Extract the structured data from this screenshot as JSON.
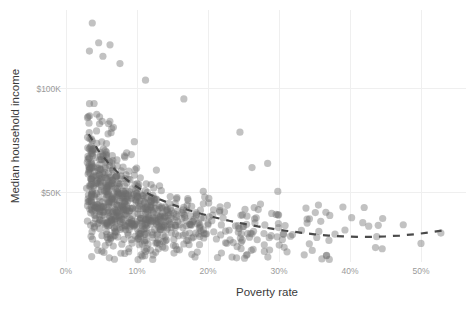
{
  "chart_data": {
    "type": "scatter",
    "title": "",
    "xlabel": "Poverty rate",
    "ylabel": "Median household income",
    "xticks": [
      "0%",
      "10%",
      "20%",
      "30%",
      "40%",
      "50%"
    ],
    "xtick_values": [
      0,
      10,
      20,
      30,
      40,
      50
    ],
    "yticks": [
      "$50K",
      "$100K"
    ],
    "ytick_values": [
      50000,
      100000
    ],
    "xlim": [
      -1.5,
      55
    ],
    "ylim": [
      14000,
      140000
    ],
    "grid": true,
    "legend": "none",
    "point_color": "#6e6e6e",
    "point_opacity": 0.42,
    "point_radius": 3.6,
    "trend": {
      "style": "dashed",
      "color": "#4a4a4a",
      "label": "",
      "points": [
        [
          3.2,
          78000
        ],
        [
          4.5,
          70500
        ],
        [
          6.0,
          64000
        ],
        [
          7.5,
          59000
        ],
        [
          9.0,
          55000
        ],
        [
          11.0,
          50500
        ],
        [
          13.0,
          47000
        ],
        [
          15.0,
          44200
        ],
        [
          17.0,
          41800
        ],
        [
          19.0,
          39800
        ],
        [
          21.0,
          38000
        ],
        [
          23.0,
          36400
        ],
        [
          25.0,
          35000
        ],
        [
          27.0,
          33700
        ],
        [
          29.0,
          32600
        ],
        [
          31.0,
          31600
        ],
        [
          33.0,
          30700
        ],
        [
          35.0,
          29900
        ],
        [
          37.0,
          29300
        ],
        [
          39.0,
          28900
        ],
        [
          41.0,
          28700
        ],
        [
          43.0,
          28700
        ],
        [
          45.0,
          28900
        ],
        [
          47.0,
          29300
        ],
        [
          49.0,
          29900
        ],
        [
          51.0,
          30700
        ],
        [
          53.0,
          31700
        ]
      ]
    },
    "series": [
      {
        "name": "counties",
        "n_points": 820,
        "description": "Median household income vs poverty rate, one point per county; strong negative hyperbolic relationship."
      }
    ]
  },
  "axes": {
    "x_label": "Poverty rate",
    "y_label": "Median household income",
    "x_tick_labels": [
      "0%",
      "10%",
      "20%",
      "30%",
      "40%",
      "50%"
    ],
    "y_tick_labels": [
      "$100K",
      "$50K"
    ]
  }
}
